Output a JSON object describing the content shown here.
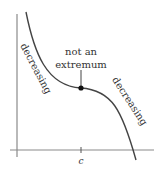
{
  "figure": {
    "type": "function-graph",
    "annotation": {
      "line1": "not an",
      "line2": "extremum"
    },
    "left_label": "decreasing",
    "right_label": "decreasing",
    "x_tick_label": "c",
    "point": {
      "x_label": "c",
      "kind": "stationary inflection point"
    },
    "colors": {
      "axis": "#8a8a8a",
      "curve": "#444444",
      "point": "#111111",
      "text": "#333333"
    }
  }
}
